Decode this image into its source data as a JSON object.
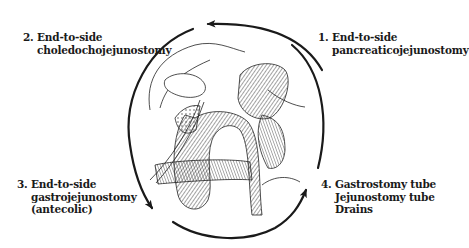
{
  "figure": {
    "type": "surgical-illustration",
    "line_color": "#1a1a1a"
  },
  "steps": [
    {
      "number": "1.",
      "lines": [
        "End-to-side",
        "pancreaticojejunostomy"
      ]
    },
    {
      "number": "2.",
      "lines": [
        "End-to-side",
        "choledochojejunostomy"
      ]
    },
    {
      "number": "3.",
      "lines": [
        "End-to-side",
        "gastrojejunostomy",
        "(antecolic)"
      ]
    },
    {
      "number": "4.",
      "lines": [
        "Gastrostomy tube",
        "Jejunostomy tube",
        "Drains"
      ]
    }
  ],
  "cycle_arrows": [
    {
      "from": "step-1",
      "to": "step-2",
      "direction": "counterclockwise"
    },
    {
      "from": "step-2",
      "to": "step-3",
      "direction": "counterclockwise"
    },
    {
      "from": "step-3",
      "to": "step-4",
      "direction": "counterclockwise"
    },
    {
      "from": "step-4",
      "to": "step-1",
      "direction": "counterclockwise"
    }
  ]
}
